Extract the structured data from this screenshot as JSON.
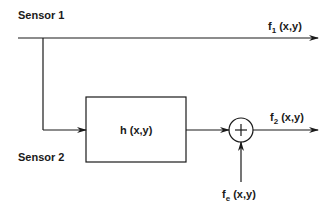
{
  "diagram": {
    "labels": {
      "sensor1": "Sensor 1",
      "sensor2": "Sensor 2",
      "block": "h (x,y)",
      "out1_base": "f",
      "out1_sub": "1",
      "out1_args": " (x,y)",
      "out2_base": "f",
      "out2_sub": "2",
      "out2_args": " (x,y)",
      "noise_base": "f",
      "noise_sub": "e",
      "noise_args": " (x,y)",
      "sum_symbol": "+"
    },
    "nodes": [
      {
        "id": "sensor1",
        "type": "source",
        "label": "Sensor 1"
      },
      {
        "id": "sensor2",
        "type": "source",
        "label": "Sensor 2"
      },
      {
        "id": "h",
        "type": "block",
        "label": "h (x,y)"
      },
      {
        "id": "sum",
        "type": "summing-junction",
        "label": "+"
      },
      {
        "id": "f1",
        "type": "output",
        "label": "f1 (x,y)"
      },
      {
        "id": "f2",
        "type": "output",
        "label": "f2 (x,y)"
      },
      {
        "id": "fe",
        "type": "input",
        "label": "fe (x,y)"
      }
    ],
    "edges": [
      {
        "from": "sensor1",
        "to": "f1"
      },
      {
        "from": "sensor1",
        "to": "h",
        "via": "branch down to Sensor 2 line"
      },
      {
        "from": "h",
        "to": "sum"
      },
      {
        "from": "fe",
        "to": "sum"
      },
      {
        "from": "sum",
        "to": "f2"
      }
    ],
    "colors": {
      "line": "#1a1a1a",
      "background": "#ffffff"
    }
  }
}
